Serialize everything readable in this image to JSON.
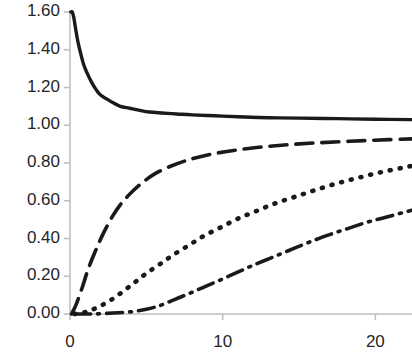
{
  "chart_data": {
    "type": "line",
    "title": "",
    "xlabel": "",
    "ylabel": "",
    "xlim": [
      0,
      22.4
    ],
    "ylim": [
      0.0,
      1.6
    ],
    "grid": false,
    "legend": "none",
    "axis_color": "#bfbfbf",
    "line_color": "#1a1a1a",
    "y_ticks": [
      {
        "value": 1.6,
        "label": "1.60"
      },
      {
        "value": 1.4,
        "label": "1.40"
      },
      {
        "value": 1.2,
        "label": "1.20"
      },
      {
        "value": 1.0,
        "label": "1.00"
      },
      {
        "value": 0.8,
        "label": "0.80"
      },
      {
        "value": 0.6,
        "label": "0.60"
      },
      {
        "value": 0.4,
        "label": "0.40"
      },
      {
        "value": 0.2,
        "label": "0.20"
      },
      {
        "value": 0.0,
        "label": "0.00"
      }
    ],
    "x_ticks": [
      {
        "value": 0,
        "label": "0"
      },
      {
        "value": 10,
        "label": "10"
      },
      {
        "value": 20,
        "label": "20"
      }
    ],
    "series": [
      {
        "name": "series-solid",
        "style": "solid",
        "dash": "",
        "width": 3.4,
        "points": [
          [
            0.05,
            1.6
          ],
          [
            0.15,
            1.6
          ],
          [
            0.25,
            1.57
          ],
          [
            0.35,
            1.52
          ],
          [
            0.5,
            1.45
          ],
          [
            0.7,
            1.38
          ],
          [
            0.9,
            1.32
          ],
          [
            1.1,
            1.28
          ],
          [
            1.4,
            1.23
          ],
          [
            1.7,
            1.19
          ],
          [
            2.0,
            1.16
          ],
          [
            2.4,
            1.14
          ],
          [
            2.8,
            1.12
          ],
          [
            3.3,
            1.1
          ],
          [
            3.9,
            1.09
          ],
          [
            4.5,
            1.08
          ],
          [
            5.2,
            1.07
          ],
          [
            6.0,
            1.065
          ],
          [
            7.0,
            1.06
          ],
          [
            8.0,
            1.055
          ],
          [
            9.5,
            1.05
          ],
          [
            11.0,
            1.045
          ],
          [
            13.0,
            1.04
          ],
          [
            15.0,
            1.038
          ],
          [
            17.5,
            1.035
          ],
          [
            20.0,
            1.032
          ],
          [
            22.4,
            1.03
          ]
        ]
      },
      {
        "name": "series-dashed",
        "style": "dashed",
        "dash": "17 9",
        "width": 3.6,
        "points": [
          [
            0.1,
            0.0
          ],
          [
            0.4,
            0.05
          ],
          [
            0.8,
            0.14
          ],
          [
            1.2,
            0.24
          ],
          [
            1.7,
            0.34
          ],
          [
            2.2,
            0.43
          ],
          [
            2.8,
            0.52
          ],
          [
            3.4,
            0.59
          ],
          [
            4.1,
            0.65
          ],
          [
            4.8,
            0.7
          ],
          [
            5.6,
            0.745
          ],
          [
            6.5,
            0.78
          ],
          [
            7.5,
            0.81
          ],
          [
            8.6,
            0.835
          ],
          [
            9.8,
            0.855
          ],
          [
            11.2,
            0.872
          ],
          [
            12.7,
            0.886
          ],
          [
            14.3,
            0.897
          ],
          [
            16.0,
            0.906
          ],
          [
            17.8,
            0.913
          ],
          [
            19.7,
            0.92
          ],
          [
            22.4,
            0.928
          ]
        ]
      },
      {
        "name": "series-dotted",
        "style": "dotted",
        "dash": "1 9",
        "width": 4.6,
        "points": [
          [
            0.3,
            0.0
          ],
          [
            1.0,
            0.01
          ],
          [
            1.8,
            0.035
          ],
          [
            2.6,
            0.07
          ],
          [
            3.4,
            0.115
          ],
          [
            4.2,
            0.165
          ],
          [
            5.0,
            0.215
          ],
          [
            5.9,
            0.265
          ],
          [
            6.8,
            0.315
          ],
          [
            7.8,
            0.365
          ],
          [
            8.8,
            0.415
          ],
          [
            9.9,
            0.46
          ],
          [
            11.0,
            0.505
          ],
          [
            12.2,
            0.545
          ],
          [
            13.4,
            0.585
          ],
          [
            14.7,
            0.62
          ],
          [
            16.0,
            0.655
          ],
          [
            17.4,
            0.69
          ],
          [
            18.8,
            0.72
          ],
          [
            20.3,
            0.75
          ],
          [
            21.8,
            0.775
          ],
          [
            22.4,
            0.785
          ]
        ]
      },
      {
        "name": "series-dash-dot",
        "style": "dashdot",
        "dash": "16 7 2 7",
        "width": 3.6,
        "points": [
          [
            0.3,
            0.0
          ],
          [
            1.5,
            0.0
          ],
          [
            2.8,
            0.005
          ],
          [
            4.0,
            0.012
          ],
          [
            5.0,
            0.025
          ],
          [
            5.9,
            0.045
          ],
          [
            6.8,
            0.075
          ],
          [
            7.7,
            0.105
          ],
          [
            8.7,
            0.14
          ],
          [
            9.7,
            0.175
          ],
          [
            10.8,
            0.215
          ],
          [
            11.9,
            0.255
          ],
          [
            13.1,
            0.295
          ],
          [
            14.3,
            0.335
          ],
          [
            15.5,
            0.375
          ],
          [
            16.8,
            0.415
          ],
          [
            18.1,
            0.45
          ],
          [
            19.4,
            0.485
          ],
          [
            20.8,
            0.515
          ],
          [
            22.4,
            0.55
          ]
        ]
      }
    ]
  }
}
